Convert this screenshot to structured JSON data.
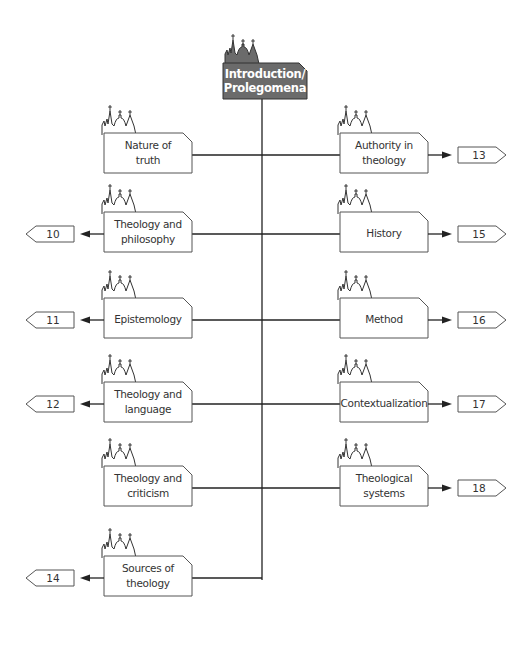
{
  "root": {
    "lines": [
      "Introduction/",
      "Prolegomena"
    ],
    "fill": "#6b6b6b",
    "text_color": "#ffffff"
  },
  "nodes": [
    {
      "id": "nature-of-truth",
      "side": "left",
      "lines": [
        "Nature of",
        "truth"
      ],
      "ref": null
    },
    {
      "id": "authority-in-theology",
      "side": "right",
      "lines": [
        "Authority in",
        "theology"
      ],
      "ref": "13"
    },
    {
      "id": "theology-and-philosophy",
      "side": "left",
      "lines": [
        "Theology and",
        "philosophy"
      ],
      "ref": "10"
    },
    {
      "id": "history",
      "side": "right",
      "lines": [
        "History"
      ],
      "ref": "15"
    },
    {
      "id": "epistemology",
      "side": "left",
      "lines": [
        "Epistemology"
      ],
      "ref": "11"
    },
    {
      "id": "method",
      "side": "right",
      "lines": [
        "Method"
      ],
      "ref": "16"
    },
    {
      "id": "theology-and-language",
      "side": "left",
      "lines": [
        "Theology and",
        "language"
      ],
      "ref": "12"
    },
    {
      "id": "contextualization",
      "side": "right",
      "lines": [
        "Contextualization"
      ],
      "ref": "17"
    },
    {
      "id": "theology-and-criticism",
      "side": "left",
      "lines": [
        "Theology and",
        "criticism"
      ],
      "ref": null
    },
    {
      "id": "theological-systems",
      "side": "right",
      "lines": [
        "Theological",
        "systems"
      ],
      "ref": "18"
    },
    {
      "id": "sources-of-theology",
      "side": "left",
      "lines": [
        "Sources of",
        "theology"
      ],
      "ref": "14"
    }
  ],
  "colors": {
    "line": "#222222",
    "box_stroke": "#555555",
    "box_fill": "#ffffff"
  },
  "icons": {
    "node": "church-skyline-icon",
    "arrow": "arrowhead-icon",
    "reference": "page-reference-tag"
  }
}
